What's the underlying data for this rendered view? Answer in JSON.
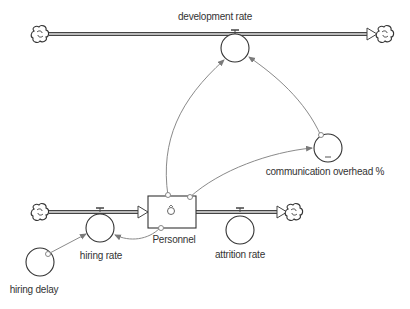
{
  "diagram": {
    "type": "stock-and-flow",
    "colors": {
      "stroke": "#3a3a3a",
      "link": "#8a8a8a",
      "label": "#333333",
      "background": "#ffffff"
    },
    "stocks": [
      {
        "id": "personnel",
        "label": "Personnel"
      }
    ],
    "flows": [
      {
        "id": "development-rate",
        "label": "development rate",
        "from": "cloud",
        "to": "cloud"
      },
      {
        "id": "hiring-rate",
        "label": "hiring rate",
        "from": "cloud",
        "to": "personnel"
      },
      {
        "id": "attrition-rate",
        "label": "attrition rate",
        "from": "personnel",
        "to": "cloud"
      }
    ],
    "auxiliaries": [
      {
        "id": "communication-overhead",
        "label": "communication overhead %"
      },
      {
        "id": "hiring-delay",
        "label": "hiring delay"
      }
    ],
    "links": [
      {
        "from": "personnel",
        "to": "development-rate"
      },
      {
        "from": "communication-overhead",
        "to": "development-rate"
      },
      {
        "from": "personnel",
        "to": "communication-overhead"
      },
      {
        "from": "personnel",
        "to": "hiring-rate"
      },
      {
        "from": "hiring-delay",
        "to": "hiring-rate"
      }
    ]
  }
}
